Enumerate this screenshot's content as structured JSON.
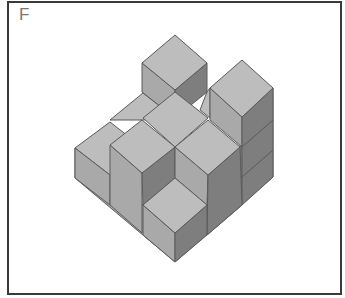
{
  "figure": {
    "label": "F",
    "colors": {
      "top_face": "#bdbdbd",
      "left_face": "#a9a9a9",
      "right_face": "#7e7e7e",
      "edge": "#5a5a5a",
      "frame": "#3a3a3a"
    }
  }
}
